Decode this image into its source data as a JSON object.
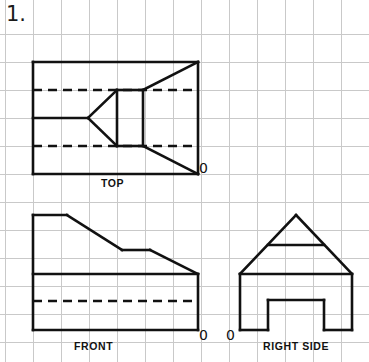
{
  "page": {
    "width": 369,
    "height": 362,
    "background_color": "#ffffff",
    "problem_number": "1.",
    "document_type": "orthographic-projection-worksheet"
  },
  "grid": {
    "visible": true,
    "line_color": "#c9c9c9",
    "spacing_px": 28,
    "origin_x": 5,
    "origin_y": 34,
    "columns": 13,
    "rows": 12
  },
  "ink": {
    "line_color": "#111111",
    "solid_stroke_width": 2.6,
    "hidden_stroke_width": 2.6,
    "hidden_dash_pattern": "9,6"
  },
  "labels": {
    "top": "TOP",
    "front": "FRONT",
    "right_side": "RIGHT  SIDE",
    "origin_top": "0",
    "origin_front": "0",
    "origin_right": "0"
  },
  "views": [
    {
      "name": "top",
      "label": "TOP",
      "bounds": {
        "x1": 33,
        "y1": 62,
        "x2": 198,
        "y2": 174
      },
      "origin_corner": "bottom-right",
      "solid_lines": [
        {
          "name": "outline-left",
          "x1": 33,
          "y1": 62,
          "x2": 33,
          "y2": 174
        },
        {
          "name": "outline-top",
          "x1": 33,
          "y1": 62,
          "x2": 198,
          "y2": 62
        },
        {
          "name": "outline-right",
          "x1": 198,
          "y1": 62,
          "x2": 198,
          "y2": 174
        },
        {
          "name": "outline-bottom",
          "x1": 33,
          "y1": 174,
          "x2": 198,
          "y2": 174
        },
        {
          "name": "vee-upper",
          "x1": 88,
          "y1": 118,
          "x2": 117,
          "y2": 90
        },
        {
          "name": "vee-lower",
          "x1": 88,
          "y1": 118,
          "x2": 117,
          "y2": 146
        },
        {
          "name": "vee-stem",
          "x1": 33,
          "y1": 118,
          "x2": 88,
          "y2": 118
        },
        {
          "name": "vertical-inner-a",
          "x1": 117,
          "y1": 90,
          "x2": 117,
          "y2": 146
        },
        {
          "name": "vertical-inner-b",
          "x1": 143,
          "y1": 90,
          "x2": 143,
          "y2": 146
        },
        {
          "name": "diag-upper-right",
          "x1": 143,
          "y1": 90,
          "x2": 198,
          "y2": 62
        },
        {
          "name": "diag-lower-right",
          "x1": 143,
          "y1": 146,
          "x2": 198,
          "y2": 174
        },
        {
          "name": "span-upper",
          "x1": 117,
          "y1": 90,
          "x2": 143,
          "y2": 90
        },
        {
          "name": "span-lower",
          "x1": 117,
          "y1": 146,
          "x2": 143,
          "y2": 146
        }
      ],
      "hidden_lines": [
        {
          "name": "hidden-upper",
          "x1": 33,
          "y1": 90,
          "x2": 198,
          "y2": 90
        },
        {
          "name": "hidden-lower",
          "x1": 33,
          "y1": 146,
          "x2": 198,
          "y2": 146
        }
      ]
    },
    {
      "name": "front",
      "label": "FRONT",
      "bounds": {
        "x1": 33,
        "y1": 215,
        "x2": 198,
        "y2": 330
      },
      "origin_corner": "bottom-right",
      "solid_lines": [
        {
          "name": "outline-left",
          "x1": 33,
          "y1": 215,
          "x2": 33,
          "y2": 330
        },
        {
          "name": "top-flat-upper",
          "x1": 33,
          "y1": 215,
          "x2": 67,
          "y2": 215
        },
        {
          "name": "slope-upper",
          "x1": 67,
          "y1": 215,
          "x2": 122,
          "y2": 250
        },
        {
          "name": "step-flat",
          "x1": 122,
          "y1": 250,
          "x2": 150,
          "y2": 250
        },
        {
          "name": "slope-lower",
          "x1": 150,
          "y1": 250,
          "x2": 198,
          "y2": 274
        },
        {
          "name": "outline-right",
          "x1": 198,
          "y1": 274,
          "x2": 198,
          "y2": 330
        },
        {
          "name": "outline-bottom",
          "x1": 33,
          "y1": 330,
          "x2": 198,
          "y2": 330
        },
        {
          "name": "shelf-line",
          "x1": 33,
          "y1": 274,
          "x2": 198,
          "y2": 274
        }
      ],
      "hidden_lines": [
        {
          "name": "hidden-mid",
          "x1": 33,
          "y1": 301,
          "x2": 198,
          "y2": 301
        }
      ]
    },
    {
      "name": "right_side",
      "label": "RIGHT  SIDE",
      "bounds": {
        "x1": 240,
        "y1": 215,
        "x2": 352,
        "y2": 330
      },
      "origin_corner": "bottom-left",
      "solid_lines": [
        {
          "name": "roof-left",
          "x1": 240,
          "y1": 274,
          "x2": 296,
          "y2": 215
        },
        {
          "name": "roof-right",
          "x1": 296,
          "y1": 215,
          "x2": 352,
          "y2": 274
        },
        {
          "name": "roof-tie-beam",
          "x1": 268,
          "y1": 245,
          "x2": 324,
          "y2": 245
        },
        {
          "name": "eave-line",
          "x1": 240,
          "y1": 274,
          "x2": 352,
          "y2": 274
        },
        {
          "name": "wall-left",
          "x1": 240,
          "y1": 274,
          "x2": 240,
          "y2": 330
        },
        {
          "name": "wall-right",
          "x1": 352,
          "y1": 274,
          "x2": 352,
          "y2": 330
        },
        {
          "name": "base-left",
          "x1": 240,
          "y1": 330,
          "x2": 268,
          "y2": 330
        },
        {
          "name": "notch-left",
          "x1": 268,
          "y1": 330,
          "x2": 268,
          "y2": 300
        },
        {
          "name": "notch-top",
          "x1": 268,
          "y1": 300,
          "x2": 324,
          "y2": 300
        },
        {
          "name": "notch-right",
          "x1": 324,
          "y1": 300,
          "x2": 324,
          "y2": 330
        },
        {
          "name": "base-right",
          "x1": 324,
          "y1": 330,
          "x2": 352,
          "y2": 330
        }
      ],
      "hidden_lines": []
    }
  ]
}
